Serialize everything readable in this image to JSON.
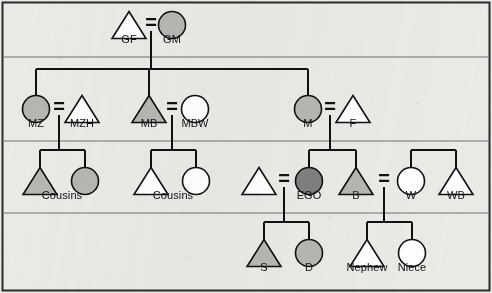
{
  "figure": {
    "border_color": "#2b2b2b",
    "background": "#eceae6",
    "line_color": "#111111",
    "divider_color": "#6f6f6f",
    "fill_light": "#b8b6b2",
    "fill_dark": "#807f7d",
    "fill_none": "#ffffff"
  },
  "marriage_symbol": "=",
  "generations": [
    {
      "name": "grandparent-generation",
      "divider_y": 57
    },
    {
      "name": "parent-generation",
      "divider_y": 141
    },
    {
      "name": "ego-generation",
      "divider_y": 213
    },
    {
      "name": "child-generation",
      "divider_y": null
    }
  ],
  "persons": [
    {
      "id": "GF",
      "label": "GF",
      "shape": "triangle",
      "fill": "none",
      "cx": 129,
      "cy": 25,
      "label_x": 129,
      "label_y": 39
    },
    {
      "id": "GM",
      "label": "GM",
      "shape": "circle",
      "fill": "light",
      "cx": 172,
      "cy": 25,
      "label_x": 172,
      "label_y": 39
    },
    {
      "id": "MZ",
      "label": "MZ",
      "shape": "circle",
      "fill": "light",
      "cx": 36,
      "cy": 109,
      "label_x": 36,
      "label_y": 123
    },
    {
      "id": "MZH",
      "label": "MZH",
      "shape": "triangle",
      "fill": "none",
      "cx": 82,
      "cy": 109,
      "label_x": 82,
      "label_y": 123
    },
    {
      "id": "MB",
      "label": "MB",
      "shape": "triangle",
      "fill": "light",
      "cx": 149,
      "cy": 109,
      "label_x": 149,
      "label_y": 123
    },
    {
      "id": "MBW",
      "label": "MBW",
      "shape": "circle",
      "fill": "none",
      "cx": 195,
      "cy": 109,
      "label_x": 195,
      "label_y": 123
    },
    {
      "id": "M",
      "label": "M",
      "shape": "circle",
      "fill": "light",
      "cx": 308,
      "cy": 109,
      "label_x": 308,
      "label_y": 123
    },
    {
      "id": "F",
      "label": "F",
      "shape": "triangle",
      "fill": "none",
      "cx": 353,
      "cy": 109,
      "label_x": 353,
      "label_y": 123
    },
    {
      "id": "COUSIN-L1",
      "label": "",
      "shape": "triangle",
      "fill": "light",
      "cx": 40,
      "cy": 181,
      "label_x": null,
      "label_y": null
    },
    {
      "id": "COUSIN-L2",
      "label": "",
      "shape": "circle",
      "fill": "light",
      "cx": 85,
      "cy": 181,
      "label_x": null,
      "label_y": null
    },
    {
      "id": "COUSINS-L",
      "label": "Cousins",
      "shape": "label",
      "fill": "none",
      "cx": 62,
      "cy": 195,
      "label_x": 62,
      "label_y": 195
    },
    {
      "id": "COUSIN-R1",
      "label": "",
      "shape": "triangle",
      "fill": "none",
      "cx": 151,
      "cy": 181,
      "label_x": null,
      "label_y": null
    },
    {
      "id": "COUSIN-R2",
      "label": "",
      "shape": "circle",
      "fill": "none",
      "cx": 196,
      "cy": 181,
      "label_x": null,
      "label_y": null
    },
    {
      "id": "COUSINS-R",
      "label": "Cousins",
      "shape": "label",
      "fill": "none",
      "cx": 173,
      "cy": 195,
      "label_x": 173,
      "label_y": 195
    },
    {
      "id": "EGOH",
      "label": "",
      "shape": "triangle",
      "fill": "none",
      "cx": 259,
      "cy": 181,
      "label_x": null,
      "label_y": null
    },
    {
      "id": "EGO",
      "label": "EGO",
      "shape": "circle",
      "fill": "dark",
      "cx": 309,
      "cy": 181,
      "label_x": 309,
      "label_y": 195
    },
    {
      "id": "B",
      "label": "B",
      "shape": "triangle",
      "fill": "light",
      "cx": 356,
      "cy": 181,
      "label_x": 356,
      "label_y": 195
    },
    {
      "id": "W",
      "label": "W",
      "shape": "circle",
      "fill": "none",
      "cx": 411,
      "cy": 181,
      "label_x": 411,
      "label_y": 195
    },
    {
      "id": "WB",
      "label": "WB",
      "shape": "triangle",
      "fill": "none",
      "cx": 456,
      "cy": 181,
      "label_x": 456,
      "label_y": 195
    },
    {
      "id": "S",
      "label": "S",
      "shape": "triangle",
      "fill": "light",
      "cx": 264,
      "cy": 253,
      "label_x": 264,
      "label_y": 267
    },
    {
      "id": "D",
      "label": "D",
      "shape": "circle",
      "fill": "light",
      "cx": 309,
      "cy": 253,
      "label_x": 309,
      "label_y": 267
    },
    {
      "id": "NEPHEW",
      "label": "Nephew",
      "shape": "triangle",
      "fill": "none",
      "cx": 367,
      "cy": 253,
      "label_x": 367,
      "label_y": 267
    },
    {
      "id": "NIECE",
      "label": "Niece",
      "shape": "circle",
      "fill": "none",
      "cx": 412,
      "cy": 253,
      "label_x": 412,
      "label_y": 267
    }
  ],
  "marriages": [
    {
      "id": "GF-GM",
      "symbol": "=",
      "x": 151,
      "y": 22,
      "descent_x": 151,
      "from_y": 31,
      "to_y": 69
    },
    {
      "id": "MZ-MZH",
      "symbol": "=",
      "x": 59,
      "y": 106,
      "descent_x": 59,
      "from_y": 115,
      "to_y": 150
    },
    {
      "id": "MB-MBW",
      "symbol": "=",
      "x": 172,
      "y": 106,
      "descent_x": 172,
      "from_y": 115,
      "to_y": 150
    },
    {
      "id": "M-F",
      "symbol": "=",
      "x": 330,
      "y": 106,
      "descent_x": 330,
      "from_y": 115,
      "to_y": 150
    },
    {
      "id": "EGOH-EGO",
      "symbol": "=",
      "x": 284,
      "y": 178,
      "descent_x": 284,
      "from_y": 187,
      "to_y": 222
    },
    {
      "id": "B-W",
      "symbol": "=",
      "x": 384,
      "y": 178,
      "descent_x": 384,
      "from_y": 187,
      "to_y": 222
    }
  ],
  "sibling_groups": [
    {
      "id": "parents-sibship",
      "bar_y": 69,
      "x_from": 36,
      "x_to": 308,
      "drop_to": 97,
      "children_x": [
        36,
        149,
        308
      ]
    },
    {
      "id": "cousins-left",
      "bar_y": 150,
      "x_from": 40,
      "x_to": 85,
      "drop_to": 170,
      "children_x": [
        40,
        85
      ]
    },
    {
      "id": "cousins-right",
      "bar_y": 150,
      "x_from": 151,
      "x_to": 196,
      "drop_to": 170,
      "children_x": [
        151,
        196
      ]
    },
    {
      "id": "ego-sibship",
      "bar_y": 150,
      "x_from": 309,
      "x_to": 356,
      "drop_to": 170,
      "children_x": [
        309,
        356
      ]
    },
    {
      "id": "wife-sibship",
      "bar_y": 150,
      "x_from": 411,
      "x_to": 456,
      "drop_to": 170,
      "children_x": [
        411,
        456
      ]
    },
    {
      "id": "ego-children",
      "bar_y": 222,
      "x_from": 264,
      "x_to": 309,
      "drop_to": 242,
      "children_x": [
        264,
        309
      ]
    },
    {
      "id": "brother-children",
      "bar_y": 222,
      "x_from": 367,
      "x_to": 412,
      "drop_to": 242,
      "children_x": [
        367,
        412
      ]
    }
  ]
}
